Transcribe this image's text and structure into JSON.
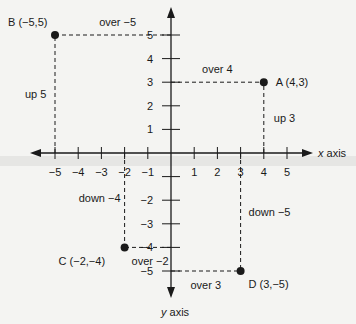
{
  "chart_data": {
    "type": "scatter",
    "title": "",
    "xlabel": "x axis",
    "ylabel": "y axis",
    "xlim": [
      -5,
      5
    ],
    "ylim": [
      -5,
      5
    ],
    "grid": false,
    "x_ticks": [
      "-5",
      "-4",
      "-3",
      "-2",
      "-1",
      "1",
      "2",
      "3",
      "4",
      "5"
    ],
    "y_ticks": [
      "5",
      "4",
      "3",
      "2",
      "1",
      "-2",
      "-3",
      "-4",
      "-5"
    ],
    "points": [
      {
        "name": "A",
        "label": "A  (4,3)",
        "x": 4,
        "y": 3,
        "over": "over 4",
        "vertical": "up 3"
      },
      {
        "name": "B",
        "label": "B  (−5,5)",
        "x": -5,
        "y": 5,
        "over": "over −5",
        "vertical": "up 5"
      },
      {
        "name": "C",
        "label": "C  (−2,−4)",
        "x": -2,
        "y": -4,
        "over": "over −2",
        "vertical": "down −4"
      },
      {
        "name": "D",
        "label": "D  (3,−5)",
        "x": 3,
        "y": -5,
        "over": "over 3",
        "vertical": "down −5"
      }
    ]
  },
  "colors": {
    "ink": "#1a1a1a",
    "paper": "#f4f4f2"
  }
}
